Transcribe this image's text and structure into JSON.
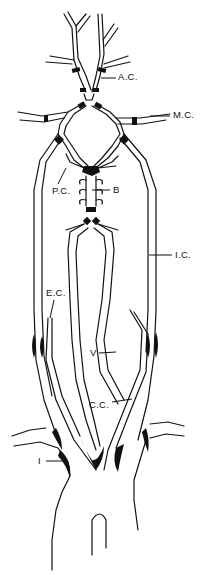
{
  "diagram": {
    "background": "#ffffff",
    "ink_color": "#111111",
    "labels": [
      {
        "id": "ac",
        "text": "A.C.",
        "x": 118,
        "y": 76
      },
      {
        "id": "mc",
        "text": "M.C.",
        "x": 173,
        "y": 114
      },
      {
        "id": "pc",
        "text": "P.C.",
        "x": 52,
        "y": 188
      },
      {
        "id": "b",
        "text": "B",
        "x": 113,
        "y": 187
      },
      {
        "id": "ic",
        "text": "I.C.",
        "x": 175,
        "y": 252
      },
      {
        "id": "ec",
        "text": "E.C.",
        "x": 46,
        "y": 289
      },
      {
        "id": "v",
        "text": "V",
        "x": 90,
        "y": 351
      },
      {
        "id": "cc",
        "text": "C.C.",
        "x": 89,
        "y": 400
      },
      {
        "id": "i",
        "text": "I",
        "x": 38,
        "y": 458
      }
    ]
  }
}
